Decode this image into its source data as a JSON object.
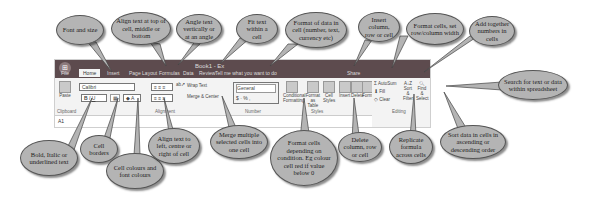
{
  "ribbon": {
    "app_icon": "⊞",
    "doc_title": "Book1 - Ex",
    "tabs": [
      "File",
      "Home",
      "Insert",
      "Page Layout",
      "Formulas",
      "Data",
      "Review"
    ],
    "tell_me": "Tell me what you want to do",
    "share": "Share",
    "font_name": "Calibri",
    "font_size": "11",
    "bold": "B",
    "italic": "I",
    "underline": "U",
    "wrap_text": "Wrap Text",
    "merge_center": "Merge & Center",
    "number_format": "General",
    "currency": "$",
    "percent": "%",
    "comma": ",",
    "conditional_formatting": "Conditional Formatting",
    "format_as_table": "Format as Table",
    "cell_styles": "Cell Styles",
    "insert": "Insert",
    "delete": "Delete",
    "format": "Format",
    "autosum": "AutoSum",
    "fill": "Fill",
    "clear": "Clear",
    "sort_filter": "Sort & Filter",
    "find_select": "Find & Select",
    "groups": [
      "Clipboard",
      "Font",
      "Alignment",
      "Number",
      "Styles",
      "Cells",
      "Editing"
    ],
    "paste": "Paste",
    "cell_ref": "A1"
  },
  "callouts": {
    "font_size": "Font and size",
    "align_vertical": "Align text at top of cell, middle or bottom",
    "angle": "Angle text vertically or at an angle",
    "fit_text": "Fit text within a cell",
    "number_format": "Format of data in cell (number, text, currency etc)",
    "insert": "Insert column, row or cell",
    "format_cells": "Format cells, set row/column width",
    "autosum": "Add together numbers in cells",
    "find": "Search for text or data within spreadsheet",
    "bold": "Bold, Italic or underlined text",
    "borders": "Cell borders",
    "colours": "Cell colours and font colours",
    "align_horizontal": "Align text to left, centre or right of cell",
    "merge": "Merge multiple selected cells into one cell",
    "conditional": "Format cells depending on condition. Eg colour cell red if value below 0",
    "delete": "Delete column, row or cell",
    "fill": "Replicate formula across cells",
    "sort": "Sort data in cells in ascending or descending order"
  }
}
